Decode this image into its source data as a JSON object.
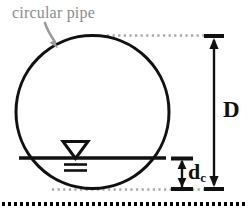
{
  "figure": {
    "background_color": "#ffffff",
    "labels": {
      "callout": "circular pipe",
      "diameter": "D",
      "critical_depth": "d",
      "critical_depth_subscript": "c"
    },
    "colors": {
      "pipe_stroke": "#111111",
      "callout_text": "#8c8c8c",
      "callout_arrow": "#9a9a9a",
      "projection_line": "#a6a6a6",
      "dimension_line": "#111111",
      "ground_line": "#000000",
      "water_surface": "#111111"
    },
    "geometry": {
      "pipe_center_x": 92,
      "pipe_center_y": 112,
      "pipe_radius": 77,
      "pipe_stroke_width": 3,
      "water_surface_y": 158,
      "water_line_x1": 21,
      "water_line_x2": 164,
      "crown_y": 35,
      "invert_y": 189,
      "dimension_axis_x": 214,
      "dc_axis_x": 182,
      "ground_line_y": 204
    },
    "elements": [
      {
        "name": "pipe-circle",
        "type": "circle"
      },
      {
        "name": "water-surface-line",
        "type": "line"
      },
      {
        "name": "water-surface-triangle",
        "type": "marker"
      },
      {
        "name": "diameter-dimension",
        "type": "dimension-arrow"
      },
      {
        "name": "critical-depth-dimension",
        "type": "dimension-arrow"
      },
      {
        "name": "crown-projection-line",
        "type": "dotted-line"
      },
      {
        "name": "invert-projection-line",
        "type": "dotted-line"
      },
      {
        "name": "ground-line",
        "type": "dotted-line"
      },
      {
        "name": "callout-arrow",
        "type": "arrow"
      }
    ]
  }
}
